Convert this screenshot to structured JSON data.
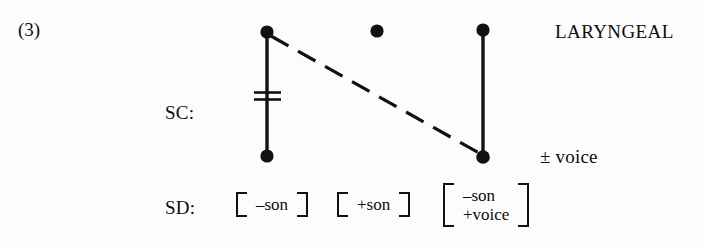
{
  "example": {
    "number": "(3)"
  },
  "tiers": {
    "sc_label": "SC:",
    "sd_label": "SD:"
  },
  "node_labels": {
    "laryngeal": "LARYNGEAL",
    "voice": "± voice"
  },
  "structural_description": {
    "matrices": [
      {
        "id": "m1",
        "rows": [
          "–son"
        ]
      },
      {
        "id": "m2",
        "rows": [
          "+son"
        ]
      },
      {
        "id": "m3",
        "rows": [
          "–son",
          "+voice"
        ]
      }
    ]
  },
  "diagram": {
    "type": "autosegmental-rule",
    "ink_color": "#111111",
    "background_color": "#fcfcfc",
    "nodes": [
      {
        "id": "n1-top",
        "x": 267,
        "y": 32,
        "filled": true
      },
      {
        "id": "n1-bottom",
        "x": 267,
        "y": 156,
        "filled": true
      },
      {
        "id": "n2-top",
        "x": 377,
        "y": 31,
        "filled": true
      },
      {
        "id": "n3-top",
        "x": 483,
        "y": 30,
        "filled": true
      },
      {
        "id": "n3-bottom",
        "x": 483,
        "y": 157,
        "filled": true
      }
    ],
    "association_lines": [
      {
        "id": "line-1",
        "from": "n1-top",
        "to": "n1-bottom",
        "style": "solid",
        "delinked": true
      },
      {
        "id": "line-3",
        "from": "n3-top",
        "to": "n3-bottom",
        "style": "solid",
        "delinked": false
      }
    ],
    "spreading_line": {
      "id": "spread-dashed",
      "from": "n1-top",
      "to": "n3-bottom",
      "style": "dashed",
      "dash_count": 7
    },
    "delink_mark": {
      "id": "delink-equals",
      "on_line": "line-1",
      "x": 267,
      "y": 96,
      "symbol": "="
    }
  }
}
